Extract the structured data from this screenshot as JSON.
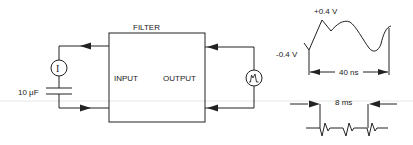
{
  "diagram": {
    "filter_label": "FILTER",
    "input_label": "INPUT",
    "output_label": "OUTPUT",
    "capacitor_label": "10 μF",
    "current_source_symbol": "I",
    "current_source_icon": "current-source-icon",
    "scope_icon": "signal-generator-icon",
    "waveform_top": {
      "max_label": "+0.4 V",
      "min_label": "-0.4 V",
      "period_label": "40 ns"
    },
    "waveform_bottom": {
      "period_label": "8 ms"
    }
  }
}
